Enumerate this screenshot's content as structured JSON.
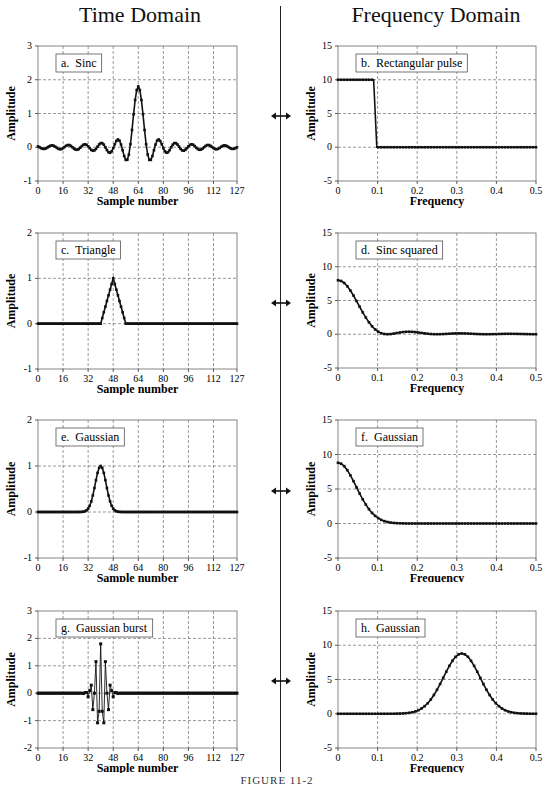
{
  "headers": {
    "left": "Time Domain",
    "right": "Frequency Domain"
  },
  "caption": "FIGURE 11-2",
  "arrow_icon": "double-headed-arrow",
  "chart_data": [
    {
      "id": "a",
      "label": "a.  Sinc",
      "type": "line",
      "marker": "square",
      "xlabel": "Sample number",
      "ylabel": "Amplitude",
      "xlim": [
        0,
        127
      ],
      "ylim": [
        -1,
        3
      ],
      "xticks": [
        0,
        16,
        32,
        48,
        64,
        80,
        96,
        112,
        127
      ],
      "yticks": [
        -1,
        0,
        1,
        2,
        3
      ],
      "generator": "sinc",
      "params": {
        "center": 64,
        "peak": 1.8,
        "period": 10.5
      }
    },
    {
      "id": "b",
      "label": "b.  Rectangular pulse",
      "type": "line",
      "marker": "square",
      "xlabel": "Frequency",
      "ylabel": "Amplitude",
      "xlim": [
        0,
        0.5
      ],
      "ylim": [
        -5,
        15
      ],
      "xticks": [
        0,
        0.1,
        0.2,
        0.3,
        0.4,
        0.5
      ],
      "yticks": [
        -5,
        0,
        5,
        10,
        15
      ],
      "generator": "rect",
      "params": {
        "cutoff": 0.09,
        "height": 10
      }
    },
    {
      "id": "c",
      "label": "c.  Triangle",
      "type": "line",
      "marker": "square",
      "xlabel": "Sample number",
      "ylabel": "Amplitude",
      "xlim": [
        0,
        127
      ],
      "ylim": [
        -1,
        2
      ],
      "xticks": [
        0,
        16,
        32,
        48,
        64,
        80,
        96,
        112,
        127
      ],
      "yticks": [
        -1,
        0,
        1,
        2
      ],
      "generator": "triangle",
      "params": {
        "center": 48,
        "halfwidth": 8,
        "peak": 1
      }
    },
    {
      "id": "d",
      "label": "d.  Sinc squared",
      "type": "line",
      "marker": "square",
      "xlabel": "Frequency",
      "ylabel": "Amplitude",
      "xlim": [
        0,
        0.5
      ],
      "ylim": [
        -5,
        15
      ],
      "xticks": [
        0,
        0.1,
        0.2,
        0.3,
        0.4,
        0.5
      ],
      "yticks": [
        -5,
        0,
        5,
        10,
        15
      ],
      "generator": "sinc2",
      "params": {
        "peak": 8,
        "n": 8
      }
    },
    {
      "id": "e",
      "label": "e.  Gaussian",
      "type": "line",
      "marker": "square",
      "xlabel": "Sample number",
      "ylabel": "Amplitude",
      "xlim": [
        0,
        127
      ],
      "ylim": [
        -1,
        2
      ],
      "xticks": [
        0,
        16,
        32,
        48,
        64,
        80,
        96,
        112,
        127
      ],
      "yticks": [
        -1,
        0,
        1,
        2
      ],
      "generator": "gauss",
      "params": {
        "center": 40,
        "sigma": 3.5,
        "peak": 1
      }
    },
    {
      "id": "f",
      "label": "f.  Gaussian",
      "type": "line",
      "marker": "square",
      "xlabel": "Frequency",
      "ylabel": "Amplitude",
      "xlim": [
        0,
        0.5
      ],
      "ylim": [
        -5,
        15
      ],
      "xticks": [
        0,
        0.1,
        0.2,
        0.3,
        0.4,
        0.5
      ],
      "yticks": [
        -5,
        0,
        5,
        10,
        15
      ],
      "generator": "gauss",
      "params": {
        "center": 0,
        "sigma": 0.046,
        "peak": 8.8
      }
    },
    {
      "id": "g",
      "label": "g.  Gaussian burst",
      "type": "line",
      "marker": "square",
      "xlabel": "Sample number",
      "ylabel": "Amplitude",
      "xlim": [
        0,
        127
      ],
      "ylim": [
        -2,
        3
      ],
      "xticks": [
        0,
        16,
        32,
        48,
        64,
        80,
        96,
        112,
        127
      ],
      "yticks": [
        -2,
        -1,
        0,
        1,
        2,
        3
      ],
      "generator": "burst",
      "params": {
        "center": 40,
        "sigma": 3.5,
        "peak": 1.8,
        "freq": 0.3125
      }
    },
    {
      "id": "h",
      "label": "h.  Gaussian",
      "type": "line",
      "marker": "square",
      "xlabel": "Frequency",
      "ylabel": "Amplitude",
      "xlim": [
        0,
        0.5
      ],
      "ylim": [
        -5,
        15
      ],
      "xticks": [
        0,
        0.1,
        0.2,
        0.3,
        0.4,
        0.5
      ],
      "yticks": [
        -5,
        0,
        5,
        10,
        15
      ],
      "generator": "gauss",
      "params": {
        "center": 0.3125,
        "sigma": 0.046,
        "peak": 8.8
      }
    }
  ],
  "layout": {
    "panels": [
      {
        "id": "a",
        "x": 0,
        "y": 38,
        "w": 277,
        "h": 170,
        "plot": [
          38,
          8,
          237,
          143
        ]
      },
      {
        "id": "b",
        "x": 277,
        "y": 38,
        "w": 277,
        "h": 170,
        "plot": [
          61,
          8,
          259,
          143
        ]
      },
      {
        "id": "c",
        "x": 0,
        "y": 225,
        "w": 277,
        "h": 170,
        "plot": [
          38,
          8,
          237,
          144
        ]
      },
      {
        "id": "d",
        "x": 277,
        "y": 225,
        "w": 277,
        "h": 170,
        "plot": [
          61,
          8,
          259,
          143
        ]
      },
      {
        "id": "e",
        "x": 0,
        "y": 412,
        "w": 277,
        "h": 170,
        "plot": [
          38,
          8,
          237,
          146
        ]
      },
      {
        "id": "f",
        "x": 277,
        "y": 412,
        "w": 277,
        "h": 170,
        "plot": [
          61,
          8,
          259,
          146
        ]
      },
      {
        "id": "g",
        "x": 0,
        "y": 603,
        "w": 277,
        "h": 170,
        "plot": [
          38,
          8,
          237,
          145
        ]
      },
      {
        "id": "h",
        "x": 277,
        "y": 603,
        "w": 277,
        "h": 170,
        "plot": [
          61,
          8,
          259,
          145
        ]
      }
    ],
    "arrows_y": [
      112,
      299,
      487,
      677
    ]
  }
}
